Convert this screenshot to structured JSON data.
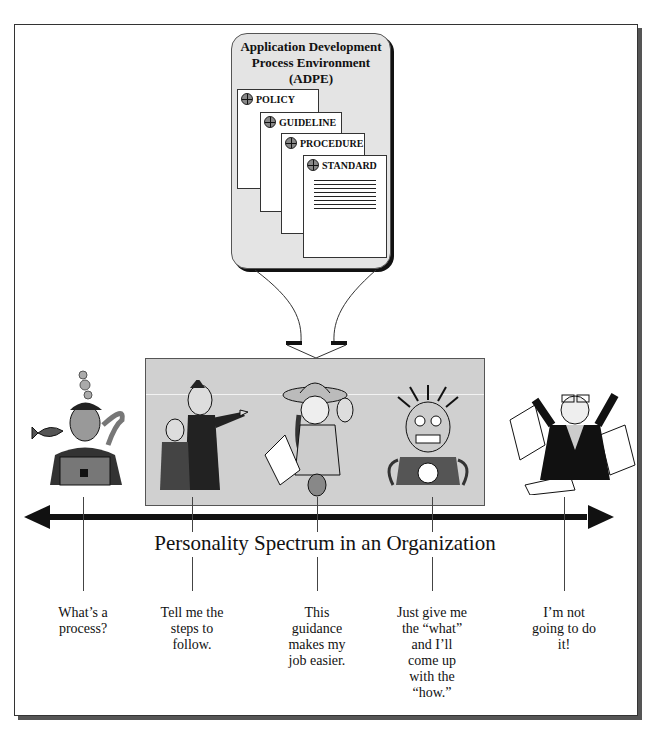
{
  "adpe": {
    "title_lines": [
      "Application Development",
      "Process Environment",
      "(ADPE)"
    ],
    "documents": [
      {
        "label": "POLICY",
        "icon": "crosshair-icon"
      },
      {
        "label": "GUIDELINE",
        "icon": "crosshair-icon"
      },
      {
        "label": "PROCEDURE",
        "icon": "crosshair-icon"
      },
      {
        "label": "STANDARD",
        "icon": "crosshair-icon"
      }
    ]
  },
  "spectrum": {
    "title": "Personality Spectrum in an Organization",
    "personalities": [
      {
        "figure": "diver-with-fish",
        "caption_lines": [
          "What’s a",
          "process?"
        ]
      },
      {
        "figure": "pointing-manager-with-assistant",
        "caption_lines": [
          "Tell me the",
          "steps to",
          "follow."
        ]
      },
      {
        "figure": "happy-explorer-with-papers",
        "caption_lines": [
          "This",
          "guidance",
          "makes my",
          "job easier."
        ]
      },
      {
        "figure": "frazzled-wired-person",
        "caption_lines": [
          "Just give me",
          "the “what”",
          "and I’ll",
          "come up",
          "with the",
          "“how.”"
        ]
      },
      {
        "figure": "angry-paper-thrower",
        "caption_lines": [
          "I’m not",
          "going to do",
          "it!"
        ]
      }
    ]
  },
  "colors": {
    "adpe_fill": "#e4e4e4",
    "panel_fill": "#d0d0d0",
    "arrow": "#111111"
  }
}
